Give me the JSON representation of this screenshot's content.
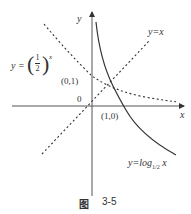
{
  "figure": {
    "caption_prefix": "图",
    "caption_number": "3-5",
    "axes": {
      "x_label": "x",
      "y_label": "y",
      "origin_label": "0"
    },
    "points": [
      {
        "label": "(0,1)"
      },
      {
        "label": "(1,0)"
      }
    ],
    "curves": [
      {
        "name": "exponential",
        "label_prefix": "y =",
        "base_num": "1",
        "base_den": "2",
        "exponent": "x",
        "style": "dashed"
      },
      {
        "name": "identity",
        "label": "y=x",
        "style": "dashed"
      },
      {
        "name": "logarithm",
        "label_prefix": "y=log",
        "base_num": "1",
        "base_den": "2",
        "arg": "x",
        "style": "solid"
      }
    ],
    "colors": {
      "stroke": "#333333",
      "background": "#ffffff"
    }
  }
}
